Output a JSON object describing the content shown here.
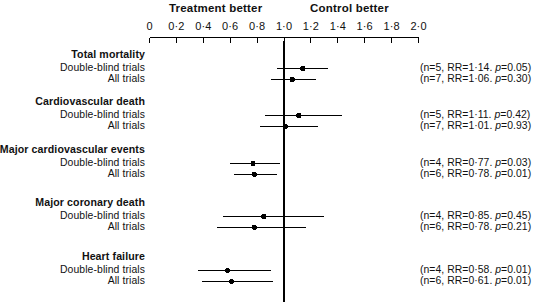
{
  "header": {
    "left_label": "Treatment better",
    "right_label": "Control better"
  },
  "axis": {
    "ticks": [
      "0",
      "0·2",
      "0·4",
      "0·6",
      "0·8",
      "1·0",
      "1·2",
      "1·4",
      "1·6",
      "1·8",
      "2·0"
    ],
    "tick_values": [
      0,
      0.2,
      0.4,
      0.6,
      0.8,
      1.0,
      1.2,
      1.4,
      1.6,
      1.8,
      2.0
    ],
    "min": 0,
    "max": 2.0,
    "null_line": 1.0
  },
  "row_labels": {
    "double_blind": "Double-blind trials",
    "all_trials": "All trials"
  },
  "groups": [
    {
      "title": "Total mortality",
      "rows": [
        {
          "label": "Double-blind trials",
          "n": 5,
          "rr": 1.14,
          "p": "0.05",
          "ci_low": 0.95,
          "ci_high": 1.33,
          "stat": "(n=5, RR=1·14. p=0.05)"
        },
        {
          "label": "All trials",
          "n": 7,
          "rr": 1.06,
          "p": "0.30",
          "ci_low": 0.9,
          "ci_high": 1.24,
          "stat": "(n=7, RR=1·06. p=0.30)"
        }
      ]
    },
    {
      "title": "Cardiovascular death",
      "rows": [
        {
          "label": "Double-blind trials",
          "n": 5,
          "rr": 1.11,
          "p": "0.42",
          "ci_low": 0.86,
          "ci_high": 1.43,
          "stat": "(n=5, RR=1·11. p=0.42)"
        },
        {
          "label": "All trials",
          "n": 7,
          "rr": 1.01,
          "p": "0.93",
          "ci_low": 0.82,
          "ci_high": 1.25,
          "stat": "(n=7, RR=1·01. p=0.93)"
        }
      ]
    },
    {
      "title": "Major cardiovascular events",
      "rows": [
        {
          "label": "Double-blind trials",
          "n": 4,
          "rr": 0.77,
          "p": "0.03",
          "ci_low": 0.6,
          "ci_high": 0.97,
          "stat": "(n=4, RR=0·77. p=0.03)"
        },
        {
          "label": "All trials",
          "n": 6,
          "rr": 0.78,
          "p": "0.01",
          "ci_low": 0.63,
          "ci_high": 0.95,
          "stat": "(n=6, RR=0·78. p=0.01)"
        }
      ]
    },
    {
      "title": "Major coronary death",
      "rows": [
        {
          "label": "Double-blind trials",
          "n": 4,
          "rr": 0.85,
          "p": "0.45",
          "ci_low": 0.55,
          "ci_high": 1.3,
          "stat": "(n=4, RR=0·85. p=0.45)"
        },
        {
          "label": "All trials",
          "n": 6,
          "rr": 0.78,
          "p": "0.21",
          "ci_low": 0.5,
          "ci_high": 1.16,
          "stat": "(n=6, RR=0·78. p=0.21)"
        }
      ]
    },
    {
      "title": "Heart failure",
      "rows": [
        {
          "label": "Double-blind trials",
          "n": 4,
          "rr": 0.58,
          "p": "0.01",
          "ci_low": 0.36,
          "ci_high": 0.9,
          "stat": "(n=4, RR=0·58. p=0.01)"
        },
        {
          "label": "All trials",
          "n": 6,
          "rr": 0.61,
          "p": "0.01",
          "ci_low": 0.39,
          "ci_high": 0.92,
          "stat": "(n=6, RR=0·61. p=0.01)"
        }
      ]
    }
  ],
  "chart_data": {
    "type": "scatter",
    "title": "",
    "xlabel": "Relative risk",
    "ylabel": "",
    "xlim": [
      0,
      2.0
    ],
    "grid": false,
    "legend": "none",
    "annotations": [
      "Treatment better",
      "Control better"
    ],
    "null_line": 1.0,
    "categories": [
      "Total mortality — Double-blind trials",
      "Total mortality — All trials",
      "Cardiovascular death — Double-blind trials",
      "Cardiovascular death — All trials",
      "Major cardiovascular events — Double-blind trials",
      "Major cardiovascular events — All trials",
      "Major coronary death — Double-blind trials",
      "Major coronary death — All trials",
      "Heart failure — Double-blind trials",
      "Heart failure — All trials"
    ],
    "values": [
      1.14,
      1.06,
      1.11,
      1.01,
      0.77,
      0.78,
      0.85,
      0.78,
      0.58,
      0.61
    ],
    "ci_low": [
      0.95,
      0.9,
      0.86,
      0.82,
      0.6,
      0.63,
      0.55,
      0.5,
      0.36,
      0.39
    ],
    "ci_high": [
      1.33,
      1.24,
      1.43,
      1.25,
      0.97,
      0.95,
      1.3,
      1.16,
      0.9,
      0.92
    ],
    "n": [
      5,
      7,
      5,
      7,
      4,
      6,
      4,
      6,
      4,
      6
    ],
    "p": [
      "0.05",
      "0.30",
      "0.42",
      "0.93",
      "0.03",
      "0.01",
      "0.45",
      "0.21",
      "0.01",
      "0.01"
    ]
  }
}
